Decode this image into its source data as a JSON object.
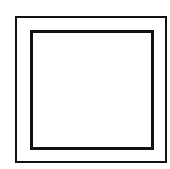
{
  "diagram": {
    "shapes": [
      {
        "type": "square",
        "role": "outer",
        "stroke": "#111111"
      },
      {
        "type": "square",
        "role": "inner",
        "stroke": "#111111"
      }
    ]
  }
}
